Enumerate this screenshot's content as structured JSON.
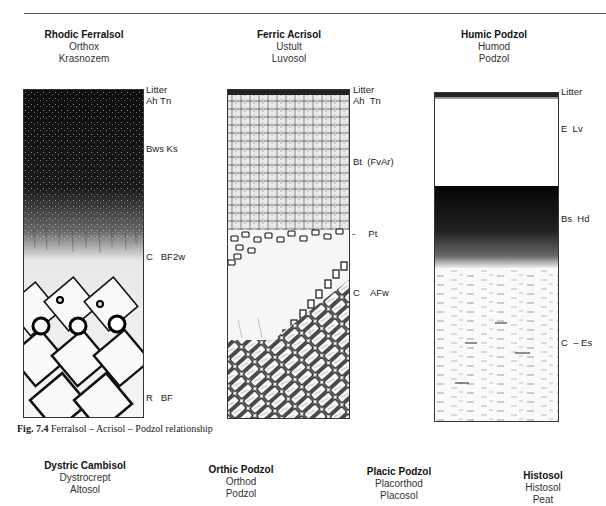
{
  "figure": {
    "caption_label": "Fig. 7.4",
    "caption_text": "Ferralsol – Acrisol – Podzol relationship"
  },
  "profiles": [
    {
      "name": "Rhodic Ferralsol",
      "synonyms": [
        "Orthox",
        "Krasnozem"
      ],
      "horizons": [
        {
          "label": "Litter",
          "y": 90
        },
        {
          "label": "Ah Tn",
          "y": 101
        },
        {
          "label": "Bws Ks",
          "y": 144
        },
        {
          "label": "C   BF2w",
          "y": 252
        },
        {
          "label": "R   BF",
          "y": 392
        }
      ]
    },
    {
      "name": "Ferric Acrisol",
      "synonyms": [
        "Ustult",
        "Luvosol"
      ],
      "horizons": [
        {
          "label": "Litter",
          "y": 90
        },
        {
          "label": "Ah  Tn",
          "y": 101
        },
        {
          "label": "Bt  (FvAr)",
          "y": 157
        },
        {
          "label": "-     Pt",
          "y": 229
        },
        {
          "label": "C    AFw",
          "y": 289
        }
      ]
    },
    {
      "name": "Humic Podzol",
      "synonyms": [
        "Humod",
        "Podzol"
      ],
      "horizons": [
        {
          "label": "Litter",
          "y": 91
        },
        {
          "label": "E  Lv",
          "y": 123
        },
        {
          "label": "Bs  Hd",
          "y": 213
        },
        {
          "label": "C  – Es",
          "y": 337
        }
      ]
    }
  ],
  "bottom_profiles": [
    {
      "name": "Dystric Cambisol",
      "synonyms": [
        "Dystrocrept",
        "Altosol"
      ]
    },
    {
      "name": "Orthic Podzol",
      "synonyms": [
        "Orthod",
        "Podzol"
      ]
    },
    {
      "name": "Placic Podzol",
      "synonyms": [
        "Placorthod",
        "Placosol"
      ]
    },
    {
      "name": "Histosol",
      "synonyms": [
        "Histosol",
        "Peat"
      ]
    }
  ]
}
